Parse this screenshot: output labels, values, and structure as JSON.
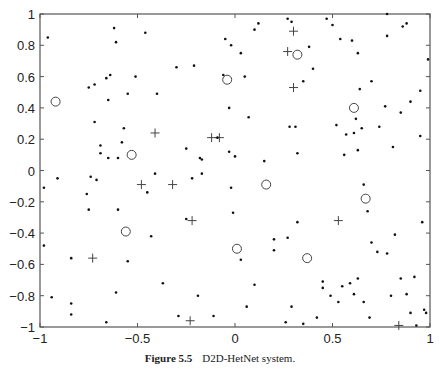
{
  "figure": {
    "label": "Figure 5.5",
    "title": "D2D-HetNet system."
  },
  "chart_data": {
    "type": "scatter",
    "title": "",
    "xlabel": "",
    "ylabel": "",
    "xlim": [
      -1,
      1
    ],
    "ylim": [
      -1,
      1
    ],
    "grid": false,
    "legend": null,
    "x_ticks": [
      "-1",
      "-0.5",
      "0",
      "0.5",
      "1"
    ],
    "y_ticks": [
      "-1",
      "-0.8",
      "-0.6",
      "-0.4",
      "-0.2",
      "0",
      "0.2",
      "0.4",
      "0.6",
      "0.8",
      "1"
    ],
    "series": [
      {
        "name": "circles",
        "marker": "o",
        "points": [
          [
            -0.92,
            0.44
          ],
          [
            -0.53,
            0.1
          ],
          [
            -0.04,
            0.58
          ],
          [
            0.32,
            0.74
          ],
          [
            0.61,
            0.4
          ],
          [
            0.16,
            -0.09
          ],
          [
            0.67,
            -0.18
          ],
          [
            -0.56,
            -0.39
          ],
          [
            0.01,
            -0.5
          ],
          [
            0.37,
            -0.56
          ]
        ]
      },
      {
        "name": "crosses",
        "marker": "+",
        "points": [
          [
            -0.41,
            0.24
          ],
          [
            -0.12,
            0.21
          ],
          [
            -0.08,
            0.21
          ],
          [
            0.3,
            0.89
          ],
          [
            0.27,
            0.76
          ],
          [
            0.3,
            0.53
          ],
          [
            -0.48,
            -0.09
          ],
          [
            -0.32,
            -0.09
          ],
          [
            -0.22,
            -0.32
          ],
          [
            -0.73,
            -0.56
          ],
          [
            0.53,
            -0.32
          ],
          [
            -0.23,
            -0.96
          ],
          [
            0.84,
            -0.99
          ]
        ]
      },
      {
        "name": "dots",
        "marker": ".",
        "points": [
          [
            -0.96,
            0.85
          ],
          [
            -0.62,
            0.91
          ],
          [
            -0.61,
            0.82
          ],
          [
            -0.46,
            0.88
          ],
          [
            -0.3,
            0.66
          ],
          [
            -0.21,
            0.67
          ],
          [
            -0.66,
            0.59
          ],
          [
            -0.64,
            0.61
          ],
          [
            -0.75,
            0.53
          ],
          [
            -0.72,
            0.55
          ],
          [
            -0.51,
            0.6
          ],
          [
            -0.55,
            0.49
          ],
          [
            -0.4,
            0.49
          ],
          [
            -0.65,
            0.45
          ],
          [
            -0.72,
            0.31
          ],
          [
            -0.57,
            0.27
          ],
          [
            -0.69,
            0.16
          ],
          [
            -0.58,
            0.18
          ],
          [
            -0.69,
            0.11
          ],
          [
            -0.65,
            0.08
          ],
          [
            -0.6,
            0.08
          ],
          [
            -0.25,
            0.14
          ],
          [
            -0.09,
            0.21
          ],
          [
            -0.18,
            0.08
          ],
          [
            -0.05,
            0.84
          ],
          [
            -0.02,
            0.8
          ],
          [
            0.03,
            0.75
          ],
          [
            -0.06,
            0.61
          ],
          [
            0.05,
            0.6
          ],
          [
            0.1,
            0.9
          ],
          [
            0.12,
            0.94
          ],
          [
            0.27,
            0.97
          ],
          [
            0.29,
            0.95
          ],
          [
            0.38,
            0.79
          ],
          [
            0.4,
            0.65
          ],
          [
            0.35,
            0.57
          ],
          [
            0.5,
            0.93
          ],
          [
            0.54,
            0.84
          ],
          [
            0.6,
            0.83
          ],
          [
            0.63,
            0.75
          ],
          [
            0.64,
            0.52
          ],
          [
            0.7,
            0.57
          ],
          [
            0.78,
            1.0
          ],
          [
            0.78,
            0.86
          ],
          [
            0.86,
            0.92
          ],
          [
            0.88,
            0.94
          ],
          [
            0.99,
            0.71
          ],
          [
            0.95,
            0.51
          ],
          [
            0.9,
            0.44
          ],
          [
            0.85,
            0.37
          ],
          [
            0.77,
            0.41
          ],
          [
            0.62,
            0.33
          ],
          [
            0.65,
            0.27
          ],
          [
            0.61,
            0.24
          ],
          [
            0.57,
            0.23
          ],
          [
            0.52,
            0.29
          ],
          [
            0.28,
            0.28
          ],
          [
            0.31,
            0.28
          ],
          [
            0.07,
            0.34
          ],
          [
            -0.03,
            0.4
          ],
          [
            0.74,
            0.28
          ],
          [
            0.81,
            0.15
          ],
          [
            0.95,
            0.22
          ],
          [
            0.63,
            0.13
          ],
          [
            0.56,
            0.1
          ],
          [
            0.32,
            0.11
          ],
          [
            0.0,
            0.09
          ],
          [
            -0.17,
            0.07
          ],
          [
            -0.98,
            -0.11
          ],
          [
            -0.91,
            -0.05
          ],
          [
            -0.74,
            -0.04
          ],
          [
            -0.71,
            -0.06
          ],
          [
            -0.76,
            -0.15
          ],
          [
            -0.75,
            -0.25
          ],
          [
            -0.6,
            -0.25
          ],
          [
            -0.45,
            -0.14
          ],
          [
            -0.41,
            -0.02
          ],
          [
            -0.22,
            -0.05
          ],
          [
            -0.17,
            -0.02
          ],
          [
            -0.25,
            -0.31
          ],
          [
            -0.43,
            -0.42
          ],
          [
            -0.98,
            -0.48
          ],
          [
            -0.84,
            -0.56
          ],
          [
            -0.55,
            -0.58
          ],
          [
            -0.37,
            -0.72
          ],
          [
            -0.61,
            -0.78
          ],
          [
            -0.94,
            -0.81
          ],
          [
            -0.84,
            -0.85
          ],
          [
            -0.84,
            -0.92
          ],
          [
            -0.66,
            -0.97
          ],
          [
            -0.29,
            -0.93
          ],
          [
            -0.19,
            -0.8
          ],
          [
            -0.11,
            -0.93
          ],
          [
            0.06,
            -0.87
          ],
          [
            -0.03,
            0.12
          ],
          [
            -0.02,
            -0.11
          ],
          [
            -0.01,
            -0.27
          ],
          [
            0.03,
            -0.57
          ],
          [
            0.1,
            -0.73
          ],
          [
            0.15,
            0.06
          ],
          [
            0.2,
            -0.51
          ],
          [
            0.27,
            -0.43
          ],
          [
            0.2,
            -0.44
          ],
          [
            0.32,
            -0.33
          ],
          [
            0.29,
            -0.87
          ],
          [
            0.26,
            -0.97
          ],
          [
            0.35,
            -0.98
          ],
          [
            0.42,
            -0.94
          ],
          [
            0.49,
            -0.8
          ],
          [
            0.53,
            -0.84
          ],
          [
            0.61,
            -0.79
          ],
          [
            0.66,
            -0.84
          ],
          [
            0.69,
            -0.94
          ],
          [
            0.73,
            -0.52
          ],
          [
            0.7,
            -0.46
          ],
          [
            0.78,
            -0.53
          ],
          [
            0.82,
            -0.41
          ],
          [
            0.68,
            -0.26
          ],
          [
            0.66,
            -0.09
          ],
          [
            0.8,
            -0.8
          ],
          [
            0.88,
            -0.79
          ],
          [
            0.9,
            -0.91
          ],
          [
            0.93,
            -0.99
          ],
          [
            0.98,
            -0.91
          ],
          [
            0.96,
            -0.33
          ],
          [
            0.85,
            -0.69
          ],
          [
            0.92,
            -0.68
          ],
          [
            0.97,
            -0.89
          ],
          [
            0.63,
            -0.69
          ],
          [
            0.59,
            -0.72
          ],
          [
            0.55,
            -0.74
          ],
          [
            0.45,
            -0.71
          ],
          [
            0.45,
            -0.75
          ],
          [
            0.47,
            0.97
          ]
        ]
      }
    ]
  }
}
